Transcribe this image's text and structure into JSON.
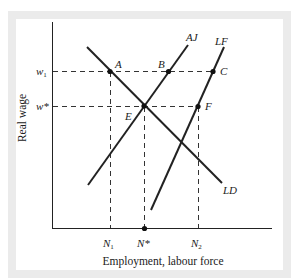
{
  "diagram": {
    "type": "labour market diagram",
    "axes": {
      "y_label": "Real wage",
      "x_label": "Employment, labour force"
    },
    "y_ticks": [
      {
        "id": "w1",
        "label": "w",
        "sub": "1"
      },
      {
        "id": "wstar",
        "label": "w*",
        "sub": ""
      }
    ],
    "x_ticks": [
      {
        "id": "N1",
        "label": "N",
        "sub": "1"
      },
      {
        "id": "Nstar",
        "label": "N*",
        "sub": ""
      },
      {
        "id": "N2",
        "label": "N",
        "sub": "2"
      }
    ],
    "curves": [
      {
        "id": "LD",
        "label": "LD",
        "description": "labour demand, downward sloping"
      },
      {
        "id": "AJ",
        "label": "AJ",
        "description": "accepting jobs, upward sloping"
      },
      {
        "id": "LF",
        "label": "LF",
        "description": "labour force, upward sloping, steeper"
      }
    ],
    "points": [
      {
        "id": "A",
        "label": "A"
      },
      {
        "id": "B",
        "label": "B"
      },
      {
        "id": "C",
        "label": "C"
      },
      {
        "id": "E",
        "label": "E"
      },
      {
        "id": "F",
        "label": "F"
      }
    ],
    "colors": {
      "frame": "#ebebeb",
      "line": "#222222"
    }
  }
}
